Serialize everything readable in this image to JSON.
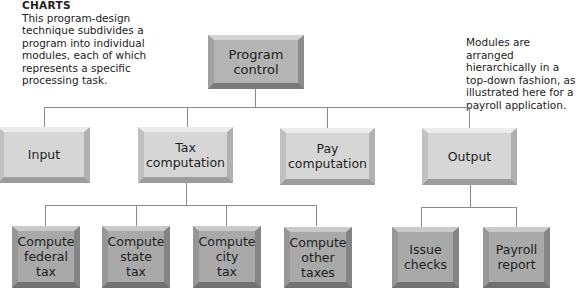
{
  "left_note": {
    "heading": "CHARTS",
    "text": "This program-design technique subdivides a program into individual modules, each of which represents a specific processing task."
  },
  "right_note": {
    "text": "Modules are arranged hierarchically in a top-down fashion, as illustrated here for a payroll application."
  },
  "tree": {
    "root": {
      "label": "Program\ncontrol"
    },
    "level1": [
      {
        "label": "Input"
      },
      {
        "label": "Tax\ncomputation"
      },
      {
        "label": "Pay\ncomputation"
      },
      {
        "label": "Output"
      }
    ],
    "tax_children": [
      {
        "label": "Compute\nfederal\ntax"
      },
      {
        "label": "Compute\nstate\ntax"
      },
      {
        "label": "Compute\ncity\ntax"
      },
      {
        "label": "Compute\nother\ntaxes"
      }
    ],
    "output_children": [
      {
        "label": "Issue\nchecks"
      },
      {
        "label": "Payroll\nreport"
      }
    ]
  },
  "colors": {
    "root_fill": "#b4b4b4",
    "level1_fill": "#d6d6d6",
    "level2_fill": "#a9a9a9",
    "connector": "#8a8a8a"
  }
}
